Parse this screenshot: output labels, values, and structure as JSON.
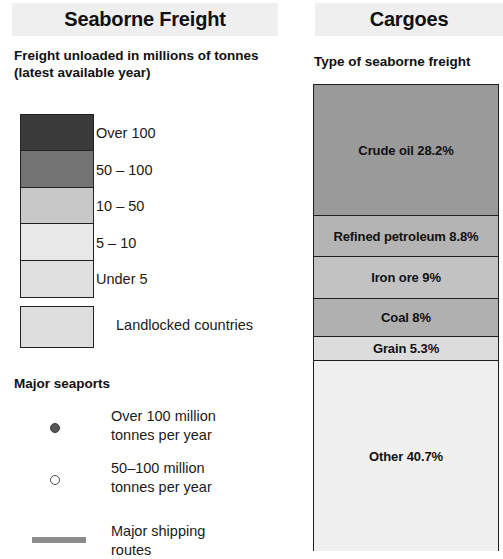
{
  "left": {
    "header_title": "Seaborne Freight",
    "legend_subtitle": "Freight unloaded in millions of tonnes (latest available year)",
    "choropleth": {
      "classes": [
        {
          "label": "Over 100",
          "color": "#3a3a3a"
        },
        {
          "label": "50 – 100",
          "color": "#737373"
        },
        {
          "label": "10 – 50",
          "color": "#c8c8c8"
        },
        {
          "label": "5 – 10",
          "color": "#e8e8e8"
        },
        {
          "label": "Under 5",
          "color": "#e0e0e0"
        }
      ]
    },
    "landlocked": {
      "label": "Landlocked countries",
      "color": "#dedede"
    },
    "seaports": {
      "heading": "Major seaports",
      "items": [
        {
          "marker": "filled-dot",
          "line1": "Over 100 million",
          "line2": "tonnes per year"
        },
        {
          "marker": "open-circle",
          "line1": "50–100 million",
          "line2": "tonnes per year"
        }
      ],
      "routes": {
        "marker": "thick-line",
        "line1": "Major shipping",
        "line2": "routes"
      }
    }
  },
  "right": {
    "header_title": "Cargoes",
    "cargo_subtitle": "Type of seaborne freight"
  },
  "chart_data": {
    "type": "bar",
    "subtype": "stacked-single-bar",
    "title": "Cargoes",
    "subtitle": "Type of seaborne freight",
    "unit": "percent",
    "categories": [
      "Crude oil",
      "Refined petroleum",
      "Iron ore",
      "Coal",
      "Grain",
      "Other"
    ],
    "values": [
      28.2,
      8.8,
      9.0,
      8.0,
      5.3,
      40.7
    ],
    "labels": [
      "Crude oil 28.2%",
      "Refined petroleum 8.8%",
      "Iron ore 9%",
      "Coal 8%",
      "Grain 5.3%",
      "Other 40.7%"
    ],
    "colors": [
      "#9a9a9a",
      "#b4b4b4",
      "#c2c2c2",
      "#b0b0b0",
      "#dcdcdc",
      "#f0f0f0"
    ],
    "ylim": [
      0,
      100
    ],
    "grid": false,
    "legend": "none",
    "xlabel": "",
    "ylabel": ""
  }
}
